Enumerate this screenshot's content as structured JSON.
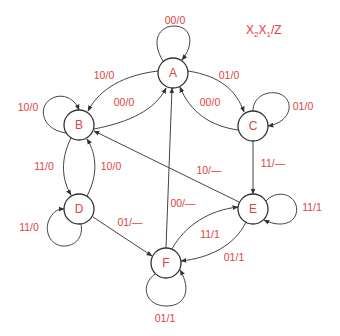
{
  "diagram": {
    "type": "state-machine",
    "legend": {
      "x2": "X",
      "sub2": "2",
      "x1": "X",
      "sub1": "1",
      "rest": "/Z"
    },
    "colors": {
      "label": "#e0443c",
      "stroke": "#444444",
      "background": "#ffffff"
    },
    "states": [
      {
        "id": "A",
        "label": "A",
        "cx": 173,
        "cy": 73
      },
      {
        "id": "B",
        "label": "B",
        "cx": 79,
        "cy": 125
      },
      {
        "id": "C",
        "label": "C",
        "cx": 253,
        "cy": 126
      },
      {
        "id": "D",
        "label": "D",
        "cx": 79,
        "cy": 209
      },
      {
        "id": "E",
        "label": "E",
        "cx": 253,
        "cy": 209
      },
      {
        "id": "F",
        "label": "F",
        "cx": 166,
        "cy": 263
      }
    ],
    "transitions": [
      {
        "from": "A",
        "to": "A",
        "label": "00/0",
        "lx": 175,
        "ly": 20
      },
      {
        "from": "A",
        "to": "B",
        "label": "10/0",
        "lx": 104,
        "ly": 75
      },
      {
        "from": "B",
        "to": "A",
        "label": "00/0",
        "lx": 124,
        "ly": 102
      },
      {
        "from": "A",
        "to": "C",
        "label": "01/0",
        "lx": 229,
        "ly": 75
      },
      {
        "from": "C",
        "to": "A",
        "label": "00/0",
        "lx": 210,
        "ly": 102
      },
      {
        "from": "B",
        "to": "B",
        "label": "10/0",
        "lx": 28,
        "ly": 107
      },
      {
        "from": "C",
        "to": "C",
        "label": "01/0",
        "lx": 303,
        "ly": 106
      },
      {
        "from": "B",
        "to": "D",
        "label": "11/0",
        "lx": 44,
        "ly": 166
      },
      {
        "from": "D",
        "to": "B",
        "label": "10/0",
        "lx": 111,
        "ly": 166
      },
      {
        "from": "D",
        "to": "D",
        "label": "11/0",
        "lx": 29,
        "ly": 227
      },
      {
        "from": "D",
        "to": "F",
        "label": "01/—",
        "lx": 130,
        "ly": 222
      },
      {
        "from": "C",
        "to": "E",
        "label": "11/—",
        "lx": 273,
        "ly": 163
      },
      {
        "from": "E",
        "to": "B",
        "label": "10/—",
        "lx": 209,
        "ly": 170
      },
      {
        "from": "F",
        "to": "A",
        "label": "00/—",
        "lx": 183,
        "ly": 203
      },
      {
        "from": "F",
        "to": "E",
        "label": "11/1",
        "lx": 210,
        "ly": 234
      },
      {
        "from": "E",
        "to": "F",
        "label": "01/1",
        "lx": 234,
        "ly": 257
      },
      {
        "from": "E",
        "to": "E",
        "label": "11/1",
        "lx": 312,
        "ly": 207
      },
      {
        "from": "F",
        "to": "F",
        "label": "01/1",
        "lx": 165,
        "ly": 318
      }
    ]
  }
}
